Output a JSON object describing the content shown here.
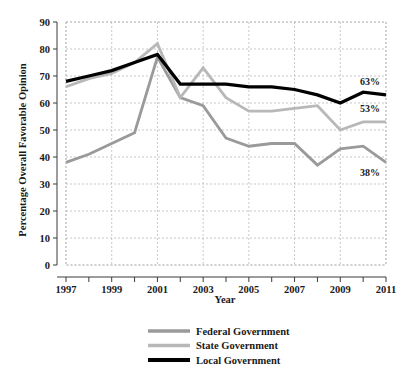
{
  "chart_data": {
    "type": "line",
    "title": "",
    "xlabel": "Year",
    "ylabel": "Percentage Overall Favorable Opinion",
    "xlim": [
      1997,
      2011
    ],
    "ylim": [
      0,
      90
    ],
    "grid": true,
    "legend_position": "bottom",
    "x": [
      1997,
      1998,
      1999,
      2000,
      2001,
      2002,
      2003,
      2004,
      2005,
      2006,
      2007,
      2008,
      2009,
      2010,
      2011
    ],
    "xticks": [
      1997,
      1999,
      2001,
      2003,
      2005,
      2007,
      2009,
      2011
    ],
    "xtick_labels": [
      "1997",
      "1999",
      "2001",
      "2003",
      "2005",
      "2007",
      "2009",
      "2011"
    ],
    "yticks": [
      0,
      10,
      20,
      30,
      40,
      50,
      60,
      70,
      80,
      90
    ],
    "ytick_labels": [
      "0",
      "10",
      "20",
      "30",
      "40",
      "50",
      "60",
      "70",
      "80",
      "90"
    ],
    "series": [
      {
        "name": "Federal Government",
        "color": "#9a9a9a",
        "values": [
          38,
          41,
          45,
          49,
          77,
          62,
          59,
          47,
          44,
          45,
          45,
          37,
          43,
          44,
          38
        ]
      },
      {
        "name": "State Government",
        "color": "#b8b8b8",
        "values": [
          66,
          69,
          71,
          75,
          82,
          62,
          73,
          62,
          57,
          57,
          58,
          59,
          50,
          53,
          53
        ]
      },
      {
        "name": "Local Government",
        "color": "#000000",
        "values": [
          68,
          70,
          72,
          75,
          78,
          67,
          67,
          67,
          66,
          66,
          65,
          63,
          60,
          64,
          63
        ]
      }
    ],
    "annotations": [
      {
        "text": "63%",
        "series": "Local Government",
        "value": 63
      },
      {
        "text": "53%",
        "series": "State Government",
        "value": 53
      },
      {
        "text": "38%",
        "series": "Federal Government",
        "value": 38
      }
    ]
  },
  "legend": {
    "items": [
      {
        "label": "Federal Government",
        "color": "#9a9a9a"
      },
      {
        "label": "State Government",
        "color": "#b8b8b8"
      },
      {
        "label": "Local Government",
        "color": "#000000"
      }
    ]
  },
  "axes": {
    "x_title": "Year",
    "y_title": "Percentage Overall Favorable Opinion"
  },
  "colors": {
    "grid": "#b0b0b0",
    "axis": "#3a3a3a",
    "text": "#1a1a1a",
    "background": "#ffffff"
  }
}
